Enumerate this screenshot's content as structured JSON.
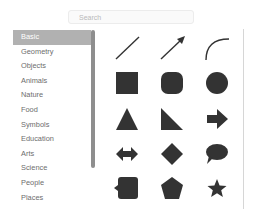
{
  "search": {
    "placeholder": "Search",
    "value": ""
  },
  "categories": [
    {
      "label": "Basic",
      "selected": true
    },
    {
      "label": "Geometry"
    },
    {
      "label": "Objects"
    },
    {
      "label": "Animals"
    },
    {
      "label": "Nature"
    },
    {
      "label": "Food"
    },
    {
      "label": "Symbols"
    },
    {
      "label": "Education"
    },
    {
      "label": "Arts"
    },
    {
      "label": "Science"
    },
    {
      "label": "People"
    },
    {
      "label": "Places"
    }
  ],
  "shapes": [
    "line",
    "arrow-line",
    "curve",
    "square",
    "rounded-square",
    "circle",
    "triangle",
    "right-triangle",
    "arrow-right",
    "double-arrow",
    "diamond",
    "speech-bubble",
    "callout-square",
    "pentagon",
    "star"
  ],
  "colors": {
    "shape_fill": "#333333",
    "selected_bg": "#b1b1b1",
    "text": "#6d6d6d"
  }
}
